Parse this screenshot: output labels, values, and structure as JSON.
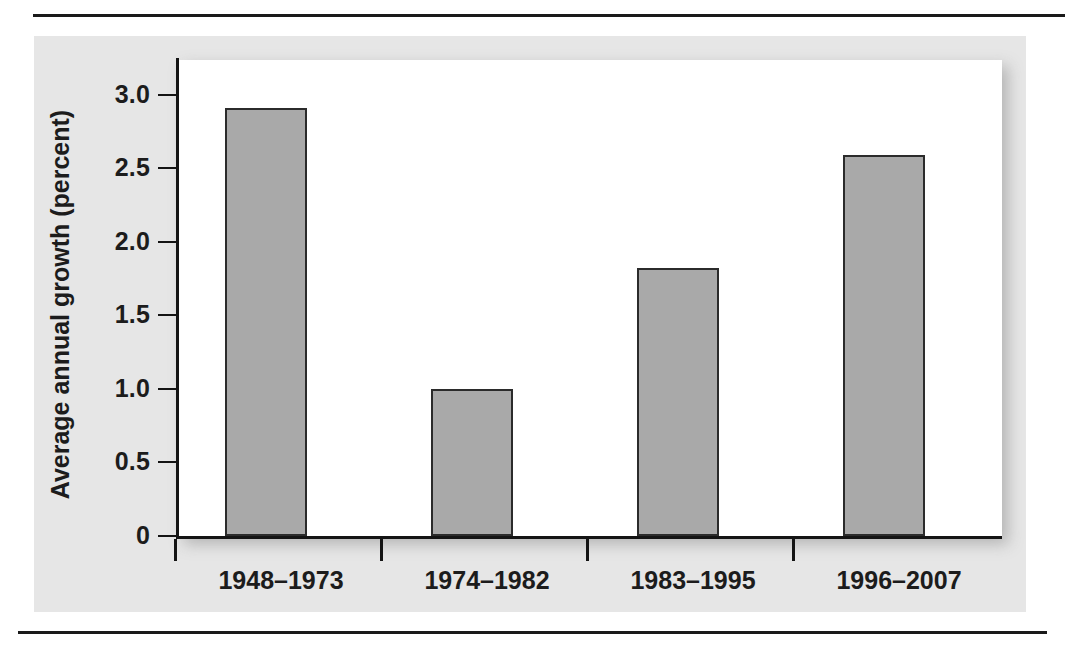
{
  "figure": {
    "background_color": "#e6e6e6",
    "plot_background_color": "#ffffff",
    "bar_fill_color": "#a9a9a9",
    "bar_edge_color": "#2b2b2b",
    "axis_color": "#141414",
    "rule_color": "#1a1a1a"
  },
  "chart_data": {
    "type": "bar",
    "title": "",
    "subtitle": "",
    "xlabel": "",
    "ylabel": "Average annual growth (percent)",
    "categories": [
      "1948–1973",
      "1974–1982",
      "1983–1995",
      "1996–2007"
    ],
    "values": [
      2.91,
      1.0,
      1.82,
      2.59
    ],
    "series": [
      {
        "name": "Average annual growth",
        "values": [
          2.91,
          1.0,
          1.82,
          2.59
        ]
      }
    ],
    "ylim": [
      0,
      3.25
    ],
    "yticks": [
      0,
      0.5,
      1.0,
      1.5,
      2.0,
      2.5,
      3.0
    ],
    "ytick_labels": [
      "0",
      "0.5",
      "1.0",
      "1.5",
      "2.0",
      "2.5",
      "3.0"
    ],
    "grid": false,
    "legend": false,
    "legend_position": "none",
    "annotations": []
  }
}
